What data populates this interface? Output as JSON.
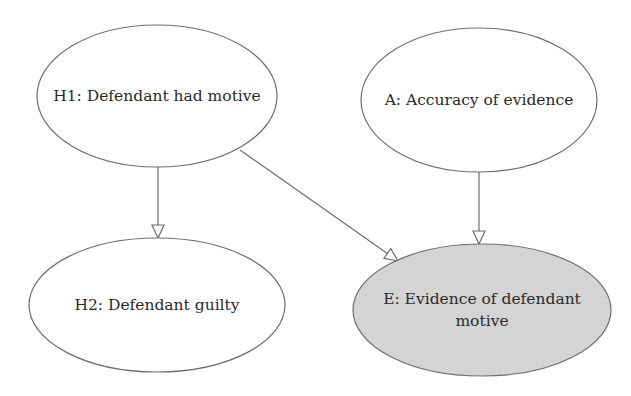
{
  "diagram": {
    "type": "bayesian-network",
    "nodes": [
      {
        "id": "H1",
        "label": "H1: Defendant had motive",
        "lines": [
          "H1: Defendant had motive"
        ],
        "observed": false
      },
      {
        "id": "A",
        "label": "A: Accuracy of evidence",
        "lines": [
          "A: Accuracy of evidence"
        ],
        "observed": false
      },
      {
        "id": "H2",
        "label": "H2: Defendant guilty",
        "lines": [
          "H2: Defendant guilty"
        ],
        "observed": false
      },
      {
        "id": "E",
        "label": "E: Evidence of defendant motive",
        "lines": [
          "E: Evidence of defendant",
          "motive"
        ],
        "observed": true
      }
    ],
    "edges": [
      {
        "from": "H1",
        "to": "H2"
      },
      {
        "from": "H1",
        "to": "E"
      },
      {
        "from": "A",
        "to": "E"
      }
    ],
    "colors": {
      "observed_fill": "#d4d4d4",
      "plain_fill": "#ffffff",
      "stroke": "#6e6e6e",
      "text": "#2a2a2a"
    }
  }
}
